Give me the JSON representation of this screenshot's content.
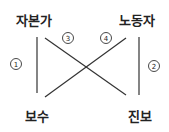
{
  "diagram": {
    "nodes": [
      {
        "id": "capitalist",
        "label": "자본가",
        "x": 34,
        "y": 19
      },
      {
        "id": "laborer",
        "label": "노동자",
        "x": 137,
        "y": 19
      },
      {
        "id": "conservative",
        "label": "보수",
        "x": 37,
        "y": 115
      },
      {
        "id": "progressive",
        "label": "진보",
        "x": 140,
        "y": 115
      }
    ],
    "edges": [
      {
        "number": "1",
        "from": "capitalist",
        "to": "conservative",
        "x1": 37,
        "y1": 37,
        "x2": 37,
        "y2": 93,
        "label_x": 16,
        "label_y": 64
      },
      {
        "number": "2",
        "from": "laborer",
        "to": "progressive",
        "x1": 139,
        "y1": 37,
        "x2": 139,
        "y2": 95,
        "label_x": 154,
        "label_y": 66
      },
      {
        "number": "3",
        "from": "capitalist",
        "to": "progressive",
        "x1": 45,
        "y1": 38,
        "x2": 126,
        "y2": 95,
        "label_x": 68,
        "label_y": 38
      },
      {
        "number": "4",
        "from": "laborer",
        "to": "conservative",
        "x1": 126,
        "y1": 38,
        "x2": 45,
        "y2": 97,
        "label_x": 106,
        "label_y": 38
      }
    ],
    "colors": {
      "line": "#333333",
      "text": "#222222",
      "background": "#ffffff"
    }
  }
}
